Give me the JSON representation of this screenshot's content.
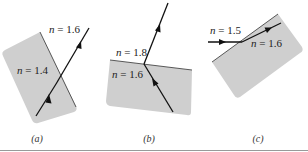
{
  "figure": {
    "panels": [
      {
        "id": "a",
        "caption": "(a)",
        "label_lower": "n = 1.4",
        "label_upper": "n = 1.6",
        "lower_index": 1.4,
        "upper_index": 1.6,
        "lower_var": "n",
        "lower_value": " = 1.4",
        "upper_var": "n",
        "upper_value": " = 1.6"
      },
      {
        "id": "b",
        "caption": "(b)",
        "label_upper": "n = 1.8",
        "label_lower": "n = 1.6",
        "upper_index": 1.8,
        "lower_index": 1.6,
        "upper_var": "n",
        "upper_value": " = 1.8",
        "lower_var": "n",
        "lower_value": " = 1.6"
      },
      {
        "id": "c",
        "caption": "(c)",
        "label_outer": "n = 1.5",
        "label_inner": "n = 1.6",
        "outer_index": 1.5,
        "inner_index": 1.6,
        "outer_var": "n",
        "outer_value": " = 1.5",
        "inner_var": "n",
        "inner_value": " = 1.6"
      }
    ],
    "colors": {
      "medium_fill": "#cfcfcf",
      "ray": "#111111",
      "interface": "#333333",
      "rule": "#9a9a9a"
    }
  }
}
